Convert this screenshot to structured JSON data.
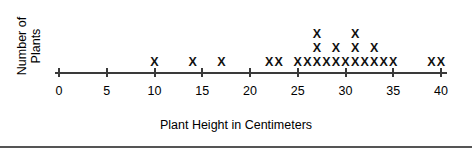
{
  "chart_data": {
    "type": "scatter",
    "plot_kind": "dot-plot",
    "title": "",
    "xlabel": "Plant Height in Centimeters",
    "ylabel_lines": [
      "Number of",
      "Plants"
    ],
    "ylabel": "Number of Plants",
    "xlim": [
      0,
      40
    ],
    "ylim": [
      0,
      3
    ],
    "grid": false,
    "legend": null,
    "tick_labels": [
      "0",
      "5",
      "10",
      "15",
      "20",
      "25",
      "30",
      "35",
      "40"
    ],
    "ticks": [
      0,
      5,
      10,
      15,
      20,
      25,
      30,
      35,
      40
    ],
    "marker": "X",
    "categories": [
      10,
      14,
      17,
      22,
      23,
      25,
      26,
      27,
      28,
      29,
      30,
      31,
      32,
      33,
      34,
      35,
      39,
      40
    ],
    "values": [
      1,
      1,
      1,
      1,
      1,
      1,
      1,
      3,
      1,
      2,
      1,
      3,
      1,
      2,
      1,
      1,
      1,
      1
    ],
    "points": [
      {
        "x": 10,
        "count": 1
      },
      {
        "x": 14,
        "count": 1
      },
      {
        "x": 17,
        "count": 1
      },
      {
        "x": 22,
        "count": 1
      },
      {
        "x": 23,
        "count": 1
      },
      {
        "x": 25,
        "count": 1
      },
      {
        "x": 26,
        "count": 1
      },
      {
        "x": 27,
        "count": 3
      },
      {
        "x": 28,
        "count": 1
      },
      {
        "x": 29,
        "count": 2
      },
      {
        "x": 30,
        "count": 1
      },
      {
        "x": 31,
        "count": 3
      },
      {
        "x": 32,
        "count": 1
      },
      {
        "x": 33,
        "count": 2
      },
      {
        "x": 34,
        "count": 1
      },
      {
        "x": 35,
        "count": 1
      },
      {
        "x": 39,
        "count": 1
      },
      {
        "x": 40,
        "count": 1
      }
    ],
    "total_marks": 23,
    "colors": {
      "axis": "#3a3a3a",
      "marker": "#111111",
      "text": "#000000",
      "rule": "#555555",
      "background": "#ffffff"
    }
  },
  "caption": {
    "text": "Plant Height in Centimeters"
  }
}
